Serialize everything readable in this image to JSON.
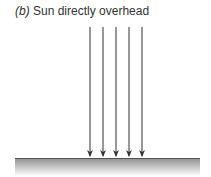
{
  "caption": {
    "label": "(b)",
    "text": " Sun directly overhead"
  },
  "diagram": {
    "arrow_count": 5,
    "arrow_color": "#333333",
    "ground_color": "#9a9a9a",
    "ground_line_color": "#555555"
  }
}
